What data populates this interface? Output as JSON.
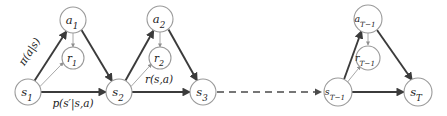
{
  "figure": {
    "kind": "mdp-trajectory-graph",
    "title": "",
    "background_color": "#ffffff",
    "node_stroke_color": "#9a9a9a",
    "strong_edge_color": "#3b3b3b",
    "light_edge_color": "#a8a8a8",
    "dashed_edge_color": "#4a4a4a",
    "text_color": "#1a1a1a"
  },
  "nodes": {
    "s1": {
      "base": "s",
      "sub": "1",
      "label": "s₁",
      "cx": 28,
      "cy": 92,
      "r": 13,
      "type": "state"
    },
    "a1": {
      "base": "a",
      "sub": "1",
      "label": "a₁",
      "cx": 73,
      "cy": 20,
      "r": 13,
      "type": "action"
    },
    "r1": {
      "base": "r",
      "sub": "1",
      "label": "r₁",
      "cx": 73,
      "cy": 58,
      "r": 11,
      "type": "reward"
    },
    "s2": {
      "base": "s",
      "sub": "2",
      "label": "s₂",
      "cx": 119,
      "cy": 92,
      "r": 13,
      "type": "state"
    },
    "a2": {
      "base": "a",
      "sub": "2",
      "label": "a₂",
      "cx": 160,
      "cy": 19,
      "r": 13,
      "type": "action"
    },
    "r2": {
      "base": "r",
      "sub": "2",
      "label": "r₂",
      "cx": 160,
      "cy": 58,
      "r": 11,
      "type": "reward"
    },
    "s3": {
      "base": "s",
      "sub": "3",
      "label": "s₃",
      "cx": 203,
      "cy": 92,
      "r": 13,
      "type": "state"
    },
    "sT1": {
      "base": "s",
      "sub": "T−1",
      "label": "s_{T-1}",
      "cx": 338,
      "cy": 92,
      "r": 14,
      "type": "state"
    },
    "aT1": {
      "base": "a",
      "sub": "T−1",
      "label": "a_{T-1}",
      "cx": 368,
      "cy": 19,
      "r": 14,
      "type": "action"
    },
    "rT1": {
      "base": "r",
      "sub": "T−1",
      "label": "r_{T-1}",
      "cx": 368,
      "cy": 58,
      "r": 12,
      "type": "reward"
    },
    "sT": {
      "base": "s",
      "sub": "T",
      "label": "s_T",
      "cx": 418,
      "cy": 92,
      "r": 14,
      "type": "state"
    }
  },
  "edge_labels": {
    "policy": "π(a|s)",
    "transition": "p(s′|s,a)",
    "reward": "r(s,a)"
  },
  "edges": [
    {
      "from": "s1",
      "to": "a1",
      "style": "strong",
      "name": "policy-edge-1"
    },
    {
      "from": "a1",
      "to": "r1",
      "style": "light",
      "name": "action-reward-edge-1"
    },
    {
      "from": "s1",
      "to": "r1",
      "style": "light",
      "name": "state-reward-edge-1"
    },
    {
      "from": "a1",
      "to": "s2",
      "style": "strong",
      "name": "action-transition-edge-1"
    },
    {
      "from": "s1",
      "to": "s2",
      "style": "strong",
      "name": "transition-edge-1"
    },
    {
      "from": "s2",
      "to": "a2",
      "style": "strong",
      "name": "policy-edge-2"
    },
    {
      "from": "a2",
      "to": "r2",
      "style": "light",
      "name": "action-reward-edge-2"
    },
    {
      "from": "s2",
      "to": "r2",
      "style": "light",
      "name": "state-reward-edge-2"
    },
    {
      "from": "a2",
      "to": "s3",
      "style": "strong",
      "name": "action-transition-edge-2"
    },
    {
      "from": "s2",
      "to": "s3",
      "style": "strong",
      "name": "transition-edge-2"
    },
    {
      "from": "s3",
      "to": "sT1",
      "style": "dashed",
      "name": "ellipsis-edge"
    },
    {
      "from": "sT1",
      "to": "aT1",
      "style": "strong",
      "name": "policy-edge-T1"
    },
    {
      "from": "aT1",
      "to": "rT1",
      "style": "light",
      "name": "action-reward-edge-T1"
    },
    {
      "from": "sT1",
      "to": "rT1",
      "style": "light",
      "name": "state-reward-edge-T1"
    },
    {
      "from": "aT1",
      "to": "sT",
      "style": "strong",
      "name": "action-transition-edge-T1"
    },
    {
      "from": "sT1",
      "to": "sT",
      "style": "strong",
      "name": "transition-edge-T1"
    }
  ]
}
